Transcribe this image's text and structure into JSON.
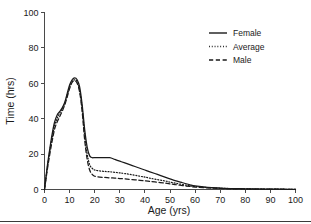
{
  "chart_data": {
    "type": "line",
    "title": "",
    "xlabel": "Age (yrs)",
    "ylabel": "Time (hrs)",
    "xlim": [
      0,
      100
    ],
    "ylim": [
      0,
      100
    ],
    "xticks": [
      0,
      10,
      20,
      30,
      40,
      50,
      60,
      70,
      80,
      90,
      100
    ],
    "yticks": [
      0,
      20,
      40,
      60,
      80,
      100
    ],
    "xticklabels": [
      "0",
      "10",
      "20",
      "30",
      "40",
      "50",
      "60",
      "70",
      "80",
      "90",
      "100"
    ],
    "yticklabels": [
      "0",
      "20",
      "40",
      "60",
      "80",
      "100"
    ],
    "grid": false,
    "legend_position": "upper right",
    "x": [
      0,
      1,
      2,
      3,
      4,
      5,
      6,
      7,
      8,
      9,
      10,
      11,
      12,
      13,
      14,
      15,
      16,
      17,
      18,
      19,
      20,
      22,
      24,
      26,
      28,
      30,
      32,
      35,
      38,
      40,
      42,
      45,
      48,
      50,
      52,
      55,
      58,
      60,
      65,
      70,
      75,
      80,
      85,
      90,
      95,
      100
    ],
    "series": [
      {
        "name": "Female",
        "style": "solid",
        "color": "#1a1a1a",
        "values": [
          0,
          12,
          22,
          31,
          38,
          42,
          44,
          46,
          49,
          54,
          59,
          62,
          63,
          62,
          58,
          48,
          34,
          24,
          19,
          18,
          18,
          18,
          18,
          18,
          17,
          16,
          15,
          13.5,
          12,
          11,
          10,
          8.5,
          7,
          6,
          5,
          3.8,
          2.6,
          2,
          1.2,
          0.8,
          0.5,
          0.4,
          0.3,
          0.2,
          0.15,
          0.1
        ]
      },
      {
        "name": "Average",
        "style": "dotted",
        "color": "#1a1a1a",
        "values": [
          0,
          11,
          21,
          29,
          36,
          40,
          43,
          45.5,
          48.5,
          53,
          58,
          61,
          62,
          61,
          56,
          46,
          31,
          20,
          14,
          12,
          11,
          10.5,
          10.2,
          10,
          9.7,
          9.4,
          9,
          8.3,
          7.5,
          7,
          6.4,
          5.6,
          4.8,
          4.2,
          3.6,
          2.8,
          2.1,
          1.7,
          1.1,
          0.7,
          0.5,
          0.35,
          0.25,
          0.2,
          0.15,
          0.1
        ]
      },
      {
        "name": "Male",
        "style": "dashed",
        "color": "#1a1a1a",
        "values": [
          0,
          10,
          19,
          27,
          34,
          38,
          41,
          44,
          47.5,
          52,
          57,
          60.5,
          61.5,
          60,
          55,
          44,
          28,
          17,
          11,
          8.5,
          7.5,
          7,
          6.8,
          6.6,
          6.4,
          6.2,
          6,
          5.6,
          5.2,
          4.9,
          4.6,
          4.1,
          3.6,
          3.2,
          2.8,
          2.2,
          1.7,
          1.4,
          0.9,
          0.6,
          0.4,
          0.3,
          0.22,
          0.18,
          0.12,
          0.08
        ]
      }
    ]
  },
  "legend": {
    "items": [
      {
        "label": "Female",
        "style": "solid"
      },
      {
        "label": "Average",
        "style": "dotted"
      },
      {
        "label": "Male",
        "style": "dashed"
      }
    ]
  },
  "axes": {
    "x_title": "Age (yrs)",
    "y_title": "Time (hrs)"
  }
}
